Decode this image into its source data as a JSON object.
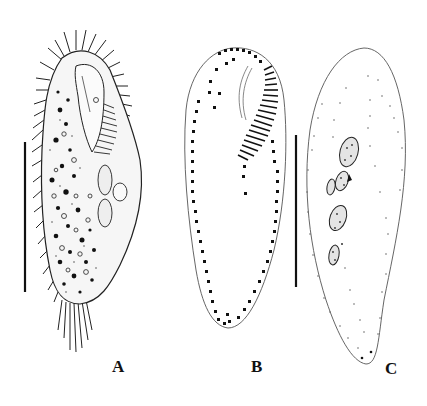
{
  "figure": {
    "panels": [
      {
        "id": "A",
        "label": "A",
        "description": "Ciliate cell, detailed drawing with cilia, granules and ellipsoid nuclei",
        "label_pos": [
          112,
          357
        ]
      },
      {
        "id": "B",
        "label": "B",
        "description": "Ciliary pattern: dotted kineties and hatched adoral zone of membranelles",
        "label_pos": [
          251,
          357
        ]
      },
      {
        "id": "C",
        "label": "C",
        "description": "Cell outline with scattered dots and macronuclear nodules",
        "label_pos": [
          385,
          359
        ]
      }
    ],
    "scale_bars": [
      {
        "panel": "A",
        "x": 25,
        "y1": 142,
        "y2": 292
      },
      {
        "panel": "B",
        "x": 296,
        "y1": 135,
        "y2": 287
      }
    ],
    "colors": {
      "ink": "#111111",
      "stipple": "#333333",
      "background": "#ffffff",
      "outline": "#555555"
    }
  }
}
